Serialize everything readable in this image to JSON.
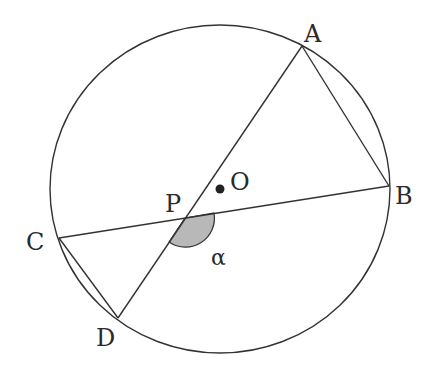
{
  "diagram": {
    "colors": {
      "stroke": "#333333",
      "angle_fill": "#b8b8b8",
      "background": "#ffffff"
    },
    "circle": {
      "cx": 220,
      "cy": 189,
      "rx": 170,
      "ry": 164
    },
    "points": {
      "A": {
        "label": "A",
        "x": 302,
        "y": 46
      },
      "B": {
        "label": "B",
        "x": 389,
        "y": 186
      },
      "C": {
        "label": "C",
        "x": 59,
        "y": 238
      },
      "D": {
        "label": "D",
        "x": 118,
        "y": 318
      },
      "P": {
        "label": "P",
        "x": 185,
        "y": 218
      },
      "O": {
        "label": "O",
        "x": 220,
        "y": 189
      }
    },
    "angle_label": "α",
    "segments": [
      "AD",
      "CB",
      "AB",
      "CD"
    ]
  }
}
